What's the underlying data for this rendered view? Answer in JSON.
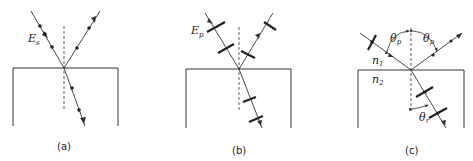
{
  "figure": {
    "colors": {
      "line": "#333333",
      "background": "#ffffff"
    },
    "panels": [
      {
        "id": "a",
        "caption": "(a)",
        "field_label": "E",
        "field_subscript": "s",
        "polarization": "s (perpendicular, dots)"
      },
      {
        "id": "b",
        "caption": "(b)",
        "field_label": "E",
        "field_subscript": "p",
        "polarization": "p (parallel, double arrows)"
      },
      {
        "id": "c",
        "caption": "(c)",
        "medium1_label": "n",
        "medium1_subscript": "1",
        "medium2_label": "n",
        "medium2_subscript": "2",
        "angle_incident_label": "θ",
        "angle_incident_subscript": "p",
        "angle_reflected_label": "θ",
        "angle_reflected_subscript": "p",
        "angle_refracted_label": "θ",
        "angle_refracted_subscript": "r",
        "polarization": "Brewster angle: reflected beam purely s-polarized"
      }
    ]
  }
}
